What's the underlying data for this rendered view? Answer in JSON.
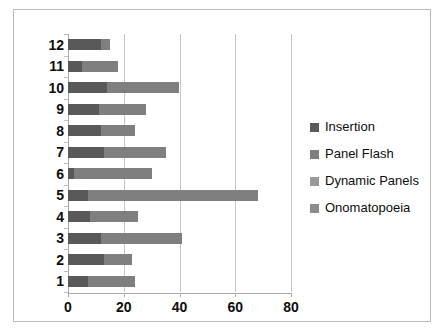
{
  "chart_data": {
    "type": "bar",
    "orientation": "horizontal",
    "stacked": true,
    "title": "",
    "xlabel": "",
    "ylabel": "",
    "categories": [
      "12",
      "11",
      "10",
      "9",
      "8",
      "7",
      "6",
      "5",
      "4",
      "3",
      "2",
      "1"
    ],
    "category_order_top_to_bottom": [
      "12",
      "11",
      "10",
      "9",
      "8",
      "7",
      "6",
      "5",
      "4",
      "3",
      "2",
      "1"
    ],
    "xlim": [
      0,
      80
    ],
    "xticks": [
      0,
      20,
      40,
      60,
      80
    ],
    "xtick_labels": [
      "0",
      "20",
      "40",
      "60",
      "80"
    ],
    "grid": "vertical",
    "legend_position": "right",
    "series": [
      {
        "name": "Insertion",
        "color": "#595959",
        "values": [
          12,
          5,
          14,
          11,
          12,
          13,
          2,
          7,
          8,
          12,
          13,
          7
        ]
      },
      {
        "name": "Panel Flash",
        "color": "#7f7f7f",
        "values": [
          3,
          13,
          26,
          17,
          12,
          22,
          28,
          61,
          17,
          29,
          10,
          17
        ]
      },
      {
        "name": "Dynamic Panels",
        "color": "#999999",
        "values": [
          0,
          0,
          0,
          0,
          0,
          0,
          0,
          0,
          0,
          0,
          0,
          0
        ]
      },
      {
        "name": "Onomatopoeia",
        "color": "#8c8c8c",
        "values": [
          0,
          0,
          0,
          0,
          0,
          0,
          0,
          0,
          0,
          0,
          0,
          0
        ]
      }
    ],
    "totals": [
      15,
      18,
      40,
      28,
      24,
      35,
      30,
      68,
      25,
      41,
      23,
      24
    ]
  },
  "legend": {
    "items": [
      {
        "label": "Insertion",
        "color": "#595959"
      },
      {
        "label": "Panel Flash",
        "color": "#7f7f7f"
      },
      {
        "label": "Dynamic Panels",
        "color": "#999999"
      },
      {
        "label": "Onomatopoeia",
        "color": "#8c8c8c"
      }
    ]
  }
}
